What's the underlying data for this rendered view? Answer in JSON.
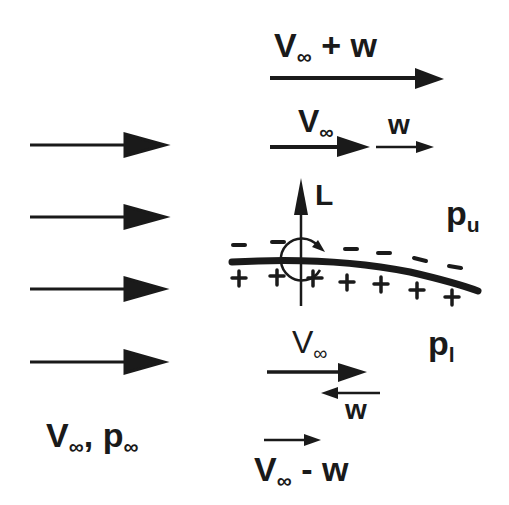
{
  "diagram": {
    "title_topic": "Lift on an airfoil from superposition of freestream and circulation",
    "freestream": {
      "label_V": "V",
      "label_sub": "∞",
      "label_sep": ", ",
      "label_p": "p",
      "label_p_sub": "∞",
      "arrow_count": 4
    },
    "upper_side": {
      "sum_label_V": "V",
      "sum_label_sub": "∞",
      "sum_label_rest": " + w",
      "component_V": "V",
      "component_V_sub": "∞",
      "component_w": "w",
      "pressure_label": "p",
      "pressure_sub": "u",
      "sign": "−"
    },
    "lower_side": {
      "component_V": "V",
      "component_V_sub": "∞",
      "component_w": "w",
      "diff_label_V": "V",
      "diff_label_sub": "∞",
      "diff_label_rest": " - w",
      "pressure_label": "p",
      "pressure_sub": "l",
      "sign": "+"
    },
    "lift": {
      "label": "L"
    },
    "colors": {
      "ink": "#1a1a1a",
      "background": "#ffffff"
    }
  }
}
